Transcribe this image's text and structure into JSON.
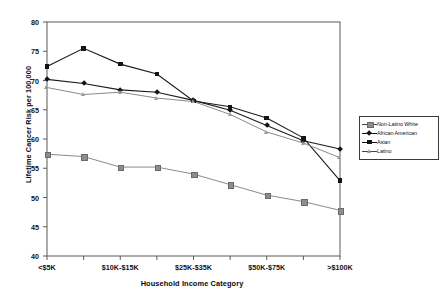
{
  "chart_data": {
    "type": "line",
    "title": "",
    "xlabel": "Household Income Category",
    "ylabel": "Lifetime Cancer Risk per 100,000",
    "ylim": [
      40,
      80
    ],
    "yticks": [
      40,
      45,
      50,
      55,
      60,
      65,
      70,
      75,
      80
    ],
    "grid": false,
    "legend_position": "right",
    "categories": [
      "<$5K",
      "$5K-$10K",
      "$10K-$15K",
      "$15K-$25K",
      "$25K-$35K",
      "$35K-$50K",
      "$50K-$75K",
      "$75K-$100K",
      ">$100K"
    ],
    "visible_tick_labels": [
      "<$5K",
      "$10K-$15K",
      "$25K-$35K",
      "$50K-$75K",
      ">$100K"
    ],
    "series": [
      {
        "name": "Non-Latino White",
        "marker": "gray-square",
        "color": "#8d8d8d",
        "values": [
          57.4,
          57.0,
          55.2,
          55.2,
          54.0,
          52.2,
          50.4,
          49.3,
          47.8
        ]
      },
      {
        "name": "African American",
        "marker": "black-diamond",
        "color": "#141414",
        "values": [
          70.2,
          69.5,
          68.4,
          68.0,
          66.6,
          64.9,
          62.3,
          59.7,
          58.3
        ]
      },
      {
        "name": "Asian",
        "marker": "black-square",
        "color": "#141414",
        "values": [
          72.4,
          75.5,
          72.8,
          71.1,
          66.5,
          65.5,
          63.6,
          60.2,
          52.9
        ]
      },
      {
        "name": "Latino",
        "marker": "gray-triangle",
        "color": "#9a9a9a",
        "values": [
          68.8,
          67.6,
          68.0,
          67.0,
          66.4,
          64.2,
          61.2,
          59.3,
          56.8
        ]
      }
    ]
  },
  "legend": {
    "items": [
      {
        "label": "Non-Latino White",
        "marker": "gray-square"
      },
      {
        "label": "African American",
        "marker": "black-diamond"
      },
      {
        "label": "Asian",
        "marker": "black-square"
      },
      {
        "label": "Latino",
        "marker": "gray-triangle"
      }
    ]
  }
}
